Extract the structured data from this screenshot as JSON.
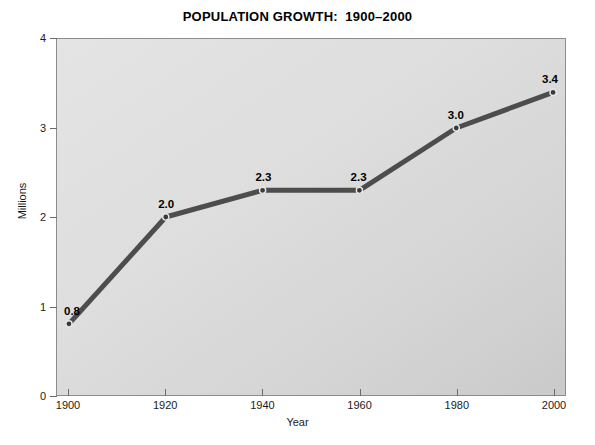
{
  "chart_data": {
    "type": "line",
    "title": "POPULATION GROWTH:  1900–2000",
    "xlabel": "Year",
    "ylabel": "Millions",
    "x": [
      1900,
      1920,
      1940,
      1960,
      1980,
      2000
    ],
    "categories": [
      "1900",
      "1920",
      "1940",
      "1960",
      "1980",
      "2000"
    ],
    "values": [
      0.8,
      2.0,
      2.3,
      2.3,
      3.0,
      3.4
    ],
    "point_labels": [
      "0.8",
      "2.0",
      "2.3",
      "2.3",
      "3.0",
      "3.4"
    ],
    "xlim": [
      1900,
      2000
    ],
    "ylim": [
      0,
      4
    ],
    "xticks": [
      1900,
      1920,
      1940,
      1960,
      1980,
      2000
    ],
    "xtick_labels": [
      "1900",
      "1920",
      "1940",
      "1960",
      "1980",
      "2000"
    ],
    "yticks": [
      0,
      1,
      2,
      3,
      4
    ],
    "ytick_labels": [
      "0",
      "1",
      "2",
      "3",
      "4"
    ],
    "grid": false,
    "legend": null,
    "series": [
      {
        "name": "Population",
        "values": [
          0.8,
          2.0,
          2.3,
          2.3,
          3.0,
          3.4
        ]
      }
    ],
    "style": {
      "line_color": "#4d4d4d",
      "line_width": 5,
      "marker_color": "#3a3a3a",
      "marker_edge_color": "#e8e8e8",
      "plot_background_light": "#e4e4e4",
      "plot_background_dark": "#cacaca",
      "frame_color": "#8c8c8c",
      "page_background": "#ffffff",
      "text_color": "#1a1a1a"
    }
  }
}
